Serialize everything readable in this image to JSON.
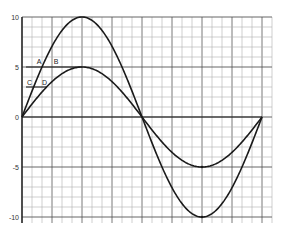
{
  "chart_data": {
    "type": "line",
    "title": "",
    "xlabel": "",
    "ylabel": "",
    "ylim": [
      -10,
      10
    ],
    "yticks": [
      10,
      5,
      0,
      -5,
      -10
    ],
    "ytick_labels": [
      "10",
      "5",
      "0",
      "-5",
      "-10"
    ],
    "grid": true,
    "legend": null,
    "series": [
      {
        "name": "large sine (amplitude 10)",
        "amplitude": 10,
        "cycles": 1
      },
      {
        "name": "small sine (amplitude 5)",
        "amplitude": 5,
        "cycles": 1
      }
    ],
    "annotations": [
      {
        "label": "A",
        "y": 5
      },
      {
        "label": "B",
        "y": 5
      },
      {
        "label": "C",
        "y": 3
      },
      {
        "label": "D",
        "y": 3
      }
    ],
    "reference_lines": [
      {
        "y": 5,
        "from_label": "A",
        "to_label": "B"
      },
      {
        "y": 3,
        "from_label": "C",
        "to_label": "D"
      }
    ]
  },
  "colors": {
    "curve": "#1a1a1a",
    "grid_minor": "#b0b0b0",
    "grid_major": "#555555",
    "axis": "#222222"
  }
}
